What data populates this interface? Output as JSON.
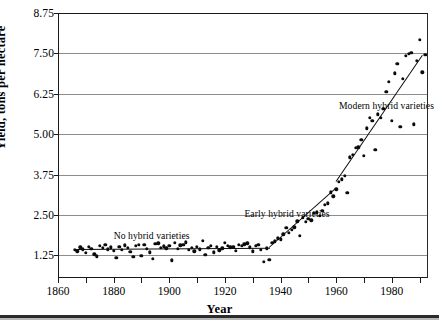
{
  "chart_data": {
    "type": "scatter",
    "title": "",
    "xlabel": "Year",
    "ylabel": "Yield, tons per hectare",
    "xlim": [
      1860,
      1993
    ],
    "ylim": [
      0.55,
      8.75
    ],
    "grid": true,
    "legend_position": "none",
    "y_ticks": [
      "1.25",
      "2.50",
      "3.75",
      "5.00",
      "6.25",
      "7.50",
      "8.75"
    ],
    "y_tick_values": [
      1.25,
      2.5,
      3.75,
      5.0,
      6.25,
      7.5,
      8.75
    ],
    "x_ticks": [
      "1860",
      "1880",
      "1900",
      "1920",
      "1940",
      "1960",
      "1980"
    ],
    "x_tick_values": [
      1860,
      1880,
      1900,
      1920,
      1940,
      1960,
      1980
    ],
    "x_minor_tick_values": [
      1860,
      1870,
      1880,
      1890,
      1900,
      1910,
      1920,
      1930,
      1940,
      1950,
      1960,
      1970,
      1980,
      1990
    ],
    "annotations": [
      {
        "text": "No hybrid varieties",
        "x": 1880,
        "y": 2.05
      },
      {
        "text": "Early hybrid varieties",
        "x": 1927,
        "y": 2.72
      },
      {
        "text": "Modern hybrid varieties",
        "x": 1961,
        "y": 6.05
      }
    ],
    "series": [
      {
        "name": "Corn yield",
        "marker": "filled-circle",
        "color": "#0b0b0b",
        "points": [
          [
            1866,
            1.42
          ],
          [
            1867,
            1.38
          ],
          [
            1868,
            1.5
          ],
          [
            1869,
            1.44
          ],
          [
            1870,
            1.33
          ],
          [
            1871,
            1.52
          ],
          [
            1872,
            1.46
          ],
          [
            1873,
            1.28
          ],
          [
            1874,
            1.22
          ],
          [
            1875,
            1.55
          ],
          [
            1876,
            1.48
          ],
          [
            1877,
            1.58
          ],
          [
            1878,
            1.44
          ],
          [
            1879,
            1.5
          ],
          [
            1880,
            1.39
          ],
          [
            1881,
            1.18
          ],
          [
            1882,
            1.52
          ],
          [
            1883,
            1.42
          ],
          [
            1884,
            1.56
          ],
          [
            1885,
            1.49
          ],
          [
            1886,
            1.36
          ],
          [
            1887,
            1.21
          ],
          [
            1888,
            1.54
          ],
          [
            1889,
            1.58
          ],
          [
            1890,
            1.24
          ],
          [
            1891,
            1.57
          ],
          [
            1892,
            1.45
          ],
          [
            1893,
            1.34
          ],
          [
            1894,
            1.15
          ],
          [
            1895,
            1.6
          ],
          [
            1896,
            1.62
          ],
          [
            1897,
            1.49
          ],
          [
            1898,
            1.53
          ],
          [
            1899,
            1.47
          ],
          [
            1900,
            1.55
          ],
          [
            1901,
            1.1
          ],
          [
            1902,
            1.64
          ],
          [
            1903,
            1.45
          ],
          [
            1904,
            1.56
          ],
          [
            1905,
            1.58
          ],
          [
            1906,
            1.66
          ],
          [
            1907,
            1.43
          ],
          [
            1908,
            1.49
          ],
          [
            1909,
            1.38
          ],
          [
            1910,
            1.52
          ],
          [
            1911,
            1.44
          ],
          [
            1912,
            1.7
          ],
          [
            1913,
            1.26
          ],
          [
            1914,
            1.48
          ],
          [
            1915,
            1.55
          ],
          [
            1916,
            1.35
          ],
          [
            1917,
            1.52
          ],
          [
            1918,
            1.41
          ],
          [
            1919,
            1.47
          ],
          [
            1920,
            1.63
          ],
          [
            1921,
            1.54
          ],
          [
            1922,
            1.5
          ],
          [
            1923,
            1.52
          ],
          [
            1924,
            1.4
          ],
          [
            1925,
            1.57
          ],
          [
            1926,
            1.55
          ],
          [
            1927,
            1.59
          ],
          [
            1928,
            1.62
          ],
          [
            1929,
            1.5
          ],
          [
            1930,
            1.38
          ],
          [
            1931,
            1.55
          ],
          [
            1932,
            1.58
          ],
          [
            1933,
            1.42
          ],
          [
            1934,
            1.05
          ],
          [
            1935,
            1.47
          ],
          [
            1936,
            1.12
          ],
          [
            1937,
            1.64
          ],
          [
            1938,
            1.68
          ],
          [
            1939,
            1.78
          ],
          [
            1940,
            1.75
          ],
          [
            1941,
            1.9
          ],
          [
            1942,
            2.1
          ],
          [
            1943,
            1.95
          ],
          [
            1944,
            2.05
          ],
          [
            1945,
            2.12
          ],
          [
            1946,
            2.3
          ],
          [
            1947,
            1.86
          ],
          [
            1948,
            2.42
          ],
          [
            1949,
            2.28
          ],
          [
            1950,
            2.38
          ],
          [
            1951,
            2.34
          ],
          [
            1952,
            2.56
          ],
          [
            1953,
            2.58
          ],
          [
            1954,
            2.48
          ],
          [
            1955,
            2.62
          ],
          [
            1956,
            2.82
          ],
          [
            1957,
            2.86
          ],
          [
            1958,
            3.2
          ],
          [
            1959,
            3.08
          ],
          [
            1960,
            3.3
          ],
          [
            1961,
            3.52
          ],
          [
            1962,
            3.6
          ],
          [
            1963,
            3.72
          ],
          [
            1964,
            3.18
          ],
          [
            1965,
            4.28
          ],
          [
            1966,
            4.36
          ],
          [
            1967,
            4.58
          ],
          [
            1968,
            4.6
          ],
          [
            1969,
            4.82
          ],
          [
            1970,
            4.34
          ],
          [
            1971,
            5.18
          ],
          [
            1972,
            5.5
          ],
          [
            1973,
            5.42
          ],
          [
            1974,
            4.52
          ],
          [
            1975,
            5.62
          ],
          [
            1976,
            5.5
          ],
          [
            1977,
            5.78
          ],
          [
            1978,
            6.32
          ],
          [
            1979,
            6.62
          ],
          [
            1980,
            5.42
          ],
          [
            1981,
            6.88
          ],
          [
            1982,
            7.18
          ],
          [
            1983,
            5.22
          ],
          [
            1984,
            6.72
          ],
          [
            1985,
            7.42
          ],
          [
            1986,
            7.48
          ],
          [
            1987,
            7.52
          ],
          [
            1988,
            5.3
          ],
          [
            1989,
            7.28
          ],
          [
            1990,
            7.92
          ],
          [
            1991,
            6.92
          ],
          [
            1992,
            7.45
          ]
        ]
      }
    ],
    "trend_segments": [
      {
        "name": "no-hybrid-trend",
        "x1": 1866,
        "y1": 1.46,
        "x2": 1936,
        "y2": 1.5
      },
      {
        "name": "early-hybrid-trend",
        "x1": 1936,
        "y1": 1.52,
        "x2": 1960,
        "y2": 3.35
      },
      {
        "name": "modern-hybrid-trend",
        "x1": 1960,
        "y1": 3.55,
        "x2": 1991,
        "y2": 7.45
      }
    ]
  }
}
